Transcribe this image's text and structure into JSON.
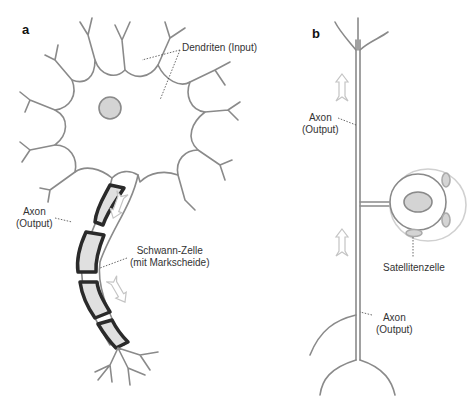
{
  "panels": [
    {
      "letter": "a"
    },
    {
      "letter": "b"
    }
  ],
  "labels": {
    "a_dendrites": "Dendriten (Input)",
    "a_axon_line1": "Axon",
    "a_axon_line2": "(Output)",
    "a_schwann_line1": "Schwann-Zelle",
    "a_schwann_line2": "(mit Markscheide)",
    "b_axon_top_line1": "Axon",
    "b_axon_top_line2": "(Output)",
    "b_satellite": "Satellitenzelle",
    "b_axon_bottom_line1": "Axon",
    "b_axon_bottom_line2": "(Output)"
  },
  "colors": {
    "outline": "#8a8a8a",
    "myelin": "#2a2a2a",
    "nucleus_fill": "#d4d4d4",
    "arrow": "#c8c8c8",
    "leader": "#444444"
  }
}
